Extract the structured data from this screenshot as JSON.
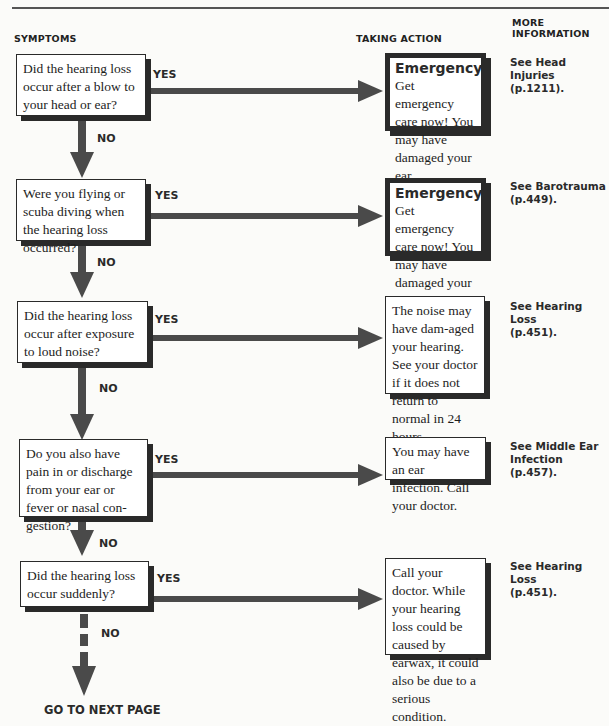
{
  "headers": {
    "symptoms": "SYMPTOMS",
    "taking_action": "TAKING ACTION",
    "more_information_line1": "MORE",
    "more_information_line2": "INFORMATION"
  },
  "labels": {
    "yes": "YES",
    "no": "NO"
  },
  "steps": [
    {
      "question": "Did the hearing loss occur after a blow to your head or ear?",
      "action_title": "Emergency!",
      "action": "Get emergency care now! You may have damaged your ear.",
      "info_line1": "See Head Injuries",
      "info_line2": "(p.1211)."
    },
    {
      "question": "Were you flying or scuba diving when the hearing loss occurred?",
      "action_title": "Emergency!",
      "action": "Get emergency care now! You may have damaged your inner ear.",
      "info_line1": "See Barotrauma",
      "info_line2": "(p.449)."
    },
    {
      "question": "Did the hearing loss occur after exposure to loud noise?",
      "action": "The noise may have dam-aged your hearing. See your doctor if it does not return to normal in 24 hours.",
      "info_line1": "See Hearing Loss",
      "info_line2": "(p.451)."
    },
    {
      "question": "Do you also have pain in or discharge from your ear or fever or nasal con-gestion?",
      "action": "You may have an ear infection. Call your doctor.",
      "info_line1": "See Middle Ear",
      "info_line2": "Infection (p.457)."
    },
    {
      "question": "Did the hearing loss occur suddenly?",
      "action": "Call your doctor. While your hearing loss could be caused by earwax, it could also be due to a serious condition.",
      "info_line1": "See Hearing Loss",
      "info_line2": "(p.451)."
    }
  ],
  "footer": "GO TO NEXT PAGE",
  "colors": {
    "ink": "#2a2a2a",
    "paper": "#fbfbf9",
    "arrow": "#4a4a4a"
  }
}
